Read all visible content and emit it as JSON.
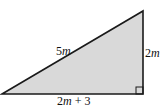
{
  "diagram": {
    "type": "right-triangle",
    "fill_color": "#d9d9d9",
    "stroke_color": "#1a1a1a",
    "labels": {
      "hypotenuse": {
        "coef": "5",
        "var": "m"
      },
      "vertical_side": {
        "coef": "2",
        "var": "m"
      },
      "base": {
        "coef": "2",
        "var": "m",
        "suffix": " + 3"
      }
    },
    "right_angle_marker": true
  }
}
